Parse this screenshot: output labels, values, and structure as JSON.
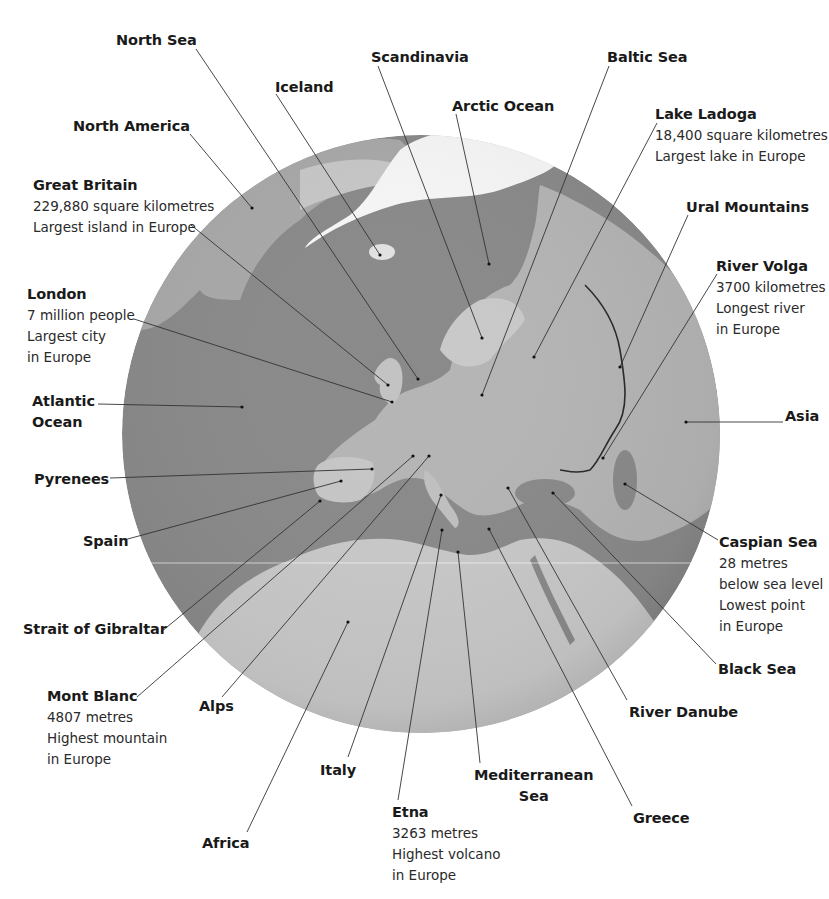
{
  "colors": {
    "background": "#ffffff",
    "ocean": "#8a8a8a",
    "land": "#b9b9b9",
    "land_light": "#d6d6d6",
    "ice": "#f7f7f7",
    "leader_line": "#333333",
    "text": "#1a1a1a"
  },
  "globe": {
    "cx": 421,
    "cy": 434,
    "r": 299
  },
  "labels": [
    {
      "id": "north-sea",
      "title": "North Sea",
      "details": [],
      "x": 116,
      "y": 30,
      "anchor": [
        196,
        49
      ],
      "target": [
        418,
        379
      ]
    },
    {
      "id": "iceland",
      "title": "Iceland",
      "details": [],
      "x": 275,
      "y": 77,
      "anchor": [
        276,
        94
      ],
      "target": [
        380,
        255
      ]
    },
    {
      "id": "scandinavia",
      "title": "Scandinavia",
      "details": [],
      "x": 371,
      "y": 47,
      "anchor": [
        378,
        66
      ],
      "target": [
        482,
        338
      ]
    },
    {
      "id": "baltic-sea",
      "title": "Baltic Sea",
      "details": [],
      "x": 607,
      "y": 47,
      "anchor": [
        609,
        66
      ],
      "target": [
        482,
        395
      ]
    },
    {
      "id": "arctic-ocean",
      "title": "Arctic Ocean",
      "details": [],
      "x": 452,
      "y": 96,
      "anchor": [
        456,
        114
      ],
      "target": [
        489,
        264
      ]
    },
    {
      "id": "north-america",
      "title": "North America",
      "details": [],
      "x": 73,
      "y": 116,
      "anchor": [
        190,
        134
      ],
      "target": [
        252,
        208
      ]
    },
    {
      "id": "lake-ladoga",
      "title": "Lake Ladoga",
      "details": [
        "18,400 square kilometres",
        "Largest lake in Europe"
      ],
      "x": 655,
      "y": 104,
      "anchor": [
        657,
        123
      ],
      "target": [
        534,
        357
      ]
    },
    {
      "id": "great-britain",
      "title": "Great Britain",
      "details": [
        "229,880 square kilometres",
        "Largest island in Europe"
      ],
      "x": 33,
      "y": 175,
      "anchor": [
        191,
        225
      ],
      "target": [
        388,
        385
      ]
    },
    {
      "id": "ural-mountains",
      "title": "Ural Mountains",
      "details": [],
      "x": 686,
      "y": 197,
      "anchor": [
        688,
        215
      ],
      "target": [
        620,
        367
      ]
    },
    {
      "id": "river-volga",
      "title": "River Volga",
      "details": [
        "3700 kilometres",
        "Longest river",
        "in Europe"
      ],
      "x": 716,
      "y": 256,
      "anchor": [
        717,
        274
      ],
      "target": [
        603,
        458
      ]
    },
    {
      "id": "london",
      "title": "London",
      "details": [
        "7 million people",
        "Largest city",
        "in Europe"
      ],
      "x": 27,
      "y": 284,
      "anchor": [
        134,
        319
      ],
      "target": [
        392,
        402
      ]
    },
    {
      "id": "atlantic-ocean",
      "title": "Atlantic\nOcean",
      "details": [],
      "x": 32,
      "y": 391,
      "anchor": [
        98,
        404
      ],
      "target": [
        242,
        407
      ]
    },
    {
      "id": "asia",
      "title": "Asia",
      "details": [],
      "x": 785,
      "y": 406,
      "anchor": [
        783,
        422
      ],
      "target": [
        686,
        422
      ]
    },
    {
      "id": "pyrenees",
      "title": "Pyrenees",
      "details": [],
      "x": 34,
      "y": 469,
      "anchor": [
        110,
        478
      ],
      "target": [
        372,
        469
      ]
    },
    {
      "id": "spain",
      "title": "Spain",
      "details": [],
      "x": 83,
      "y": 531,
      "anchor": [
        124,
        540
      ],
      "target": [
        341,
        481
      ]
    },
    {
      "id": "strait-of-gibraltar",
      "title": "Strait of Gibraltar",
      "details": [],
      "x": 23,
      "y": 619,
      "anchor": [
        161,
        632
      ],
      "target": [
        320,
        501
      ]
    },
    {
      "id": "caspian-sea",
      "title": "Caspian Sea",
      "details": [
        "28 metres",
        "below sea level",
        "Lowest point",
        "in Europe"
      ],
      "x": 719,
      "y": 532,
      "anchor": [
        718,
        540
      ],
      "target": [
        625,
        484
      ]
    },
    {
      "id": "black-sea",
      "title": "Black Sea",
      "details": [],
      "x": 718,
      "y": 659,
      "anchor": [
        716,
        664
      ],
      "target": [
        553,
        493
      ]
    },
    {
      "id": "mont-blanc",
      "title": "Mont Blanc",
      "details": [
        "4807 metres",
        "Highest mountain",
        "in Europe"
      ],
      "x": 47,
      "y": 686,
      "anchor": [
        137,
        697
      ],
      "target": [
        413,
        456
      ]
    },
    {
      "id": "alps",
      "title": "Alps",
      "details": [],
      "x": 199,
      "y": 696,
      "anchor": [
        222,
        697
      ],
      "target": [
        429,
        456
      ]
    },
    {
      "id": "river-danube",
      "title": "River Danube",
      "details": [],
      "x": 629,
      "y": 702,
      "anchor": [
        627,
        700
      ],
      "target": [
        508,
        488
      ]
    },
    {
      "id": "italy",
      "title": "Italy",
      "details": [],
      "x": 320,
      "y": 760,
      "anchor": [
        348,
        757
      ],
      "target": [
        441,
        495
      ]
    },
    {
      "id": "mediterranean-sea",
      "title": "Mediterranean\nSea",
      "details": [],
      "x": 474,
      "y": 765,
      "anchor": [
        480,
        763
      ],
      "target": [
        458,
        552
      ]
    },
    {
      "id": "etna",
      "title": "Etna",
      "details": [
        "3263 metres",
        "Highest volcano",
        "in Europe"
      ],
      "x": 392,
      "y": 802,
      "anchor": [
        398,
        800
      ],
      "target": [
        442,
        530
      ]
    },
    {
      "id": "greece",
      "title": "Greece",
      "details": [],
      "x": 633,
      "y": 808,
      "anchor": [
        632,
        806
      ],
      "target": [
        489,
        529
      ]
    },
    {
      "id": "africa",
      "title": "Africa",
      "details": [],
      "x": 202,
      "y": 833,
      "anchor": [
        247,
        832
      ],
      "target": [
        348,
        622
      ]
    }
  ]
}
